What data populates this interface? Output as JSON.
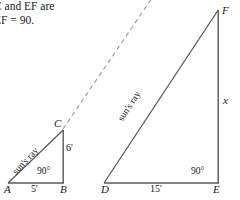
{
  "problem": {
    "line1": "C and EF are",
    "line2": "EF = 90."
  },
  "colors": {
    "stroke": "#595959",
    "dashed": "#9a9a9a",
    "text": "#1a1a1a",
    "background": "#ffffff"
  },
  "small_triangle": {
    "name": "triangle-abc",
    "vertices": {
      "a_label": "A",
      "b_label": "B",
      "c_label": "C"
    },
    "base_length": "5'",
    "height_length": "6'",
    "right_angle": "90°",
    "hypotenuse_label": "sun's ray",
    "points": {
      "a": [
        8,
        190
      ],
      "b": [
        64,
        190
      ],
      "c": [
        62,
        130
      ]
    }
  },
  "large_triangle": {
    "name": "triangle-def",
    "vertices": {
      "d_label": "D",
      "e_label": "E",
      "f_label": "F"
    },
    "base_length": "15'",
    "height_length": "x",
    "right_angle": "90°",
    "hypotenuse_label": "sun's ray",
    "points": {
      "d": [
        105,
        183
      ],
      "e": [
        218,
        183
      ],
      "f": [
        218,
        10
      ]
    }
  },
  "dashed_ray": {
    "name": "sun-ray-extension",
    "from": [
      62,
      130
    ],
    "to": [
      150,
      0
    ]
  }
}
